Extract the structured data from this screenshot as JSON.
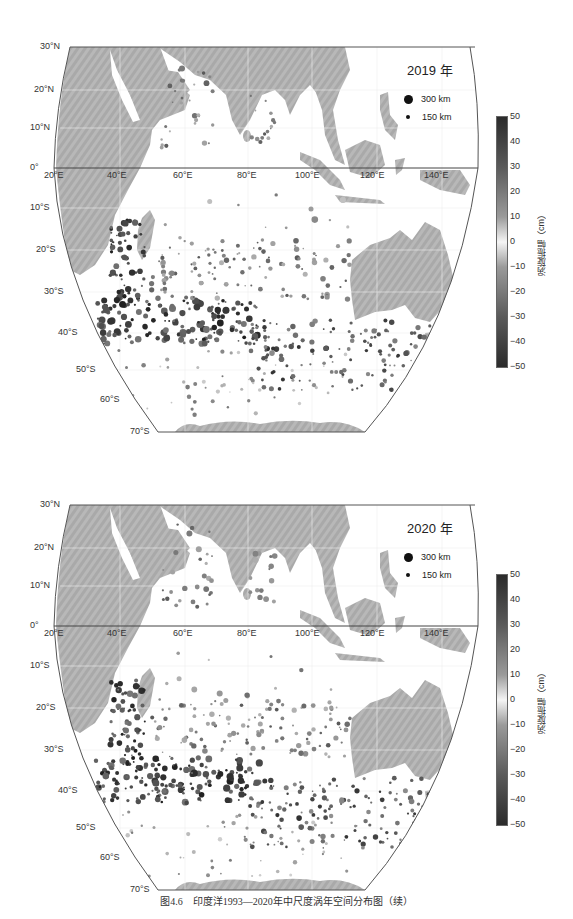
{
  "figure": {
    "caption": "图4.6　印度洋1993—2020年中尺度涡年空间分布图（续）"
  },
  "panels": [
    {
      "year_label": "2019 年",
      "legend": [
        {
          "label": "300 km",
          "size": 9
        },
        {
          "label": "150 km",
          "size": 4
        }
      ],
      "lat_labels": [
        "30°N",
        "20°N",
        "10°N",
        "0°",
        "10°S",
        "20°S",
        "30°S",
        "40°S",
        "50°S",
        "60°S",
        "70°S"
      ],
      "lon_labels": [
        "20°E",
        "40°E",
        "60°E",
        "80°E",
        "100°E",
        "120°E",
        "140°E"
      ],
      "colorbar": {
        "title": "涡旋振幅（cm）",
        "ticks": [
          "50",
          "40",
          "30",
          "20",
          "10",
          "0",
          "−10",
          "−20",
          "−30",
          "−40",
          "−50"
        ]
      }
    },
    {
      "year_label": "2020 年",
      "legend": [
        {
          "label": "300 km",
          "size": 9
        },
        {
          "label": "150 km",
          "size": 4
        }
      ],
      "lat_labels": [
        "30°N",
        "20°N",
        "10°N",
        "0°",
        "10°S",
        "20°S",
        "30°S",
        "40°S",
        "50°S",
        "60°S",
        "70°S"
      ],
      "lon_labels": [
        "20°E",
        "40°E",
        "60°E",
        "80°E",
        "100°E",
        "120°E",
        "140°E"
      ],
      "colorbar": {
        "title": "涡旋振幅（cm）",
        "ticks": [
          "50",
          "40",
          "30",
          "20",
          "10",
          "0",
          "−10",
          "−20",
          "−30",
          "−40",
          "−50"
        ]
      }
    }
  ],
  "chart_data": [
    {
      "type": "scatter",
      "title": "2019 年",
      "subtitle": "Indian Ocean mesoscale eddy spatial distribution",
      "xlabel": "Longitude",
      "ylabel": "Latitude",
      "xlim": [
        20,
        150
      ],
      "ylim": [
        -70,
        30
      ],
      "x_ticks": [
        "20°E",
        "40°E",
        "60°E",
        "80°E",
        "100°E",
        "120°E",
        "140°E"
      ],
      "y_ticks": [
        "30°N",
        "20°N",
        "10°N",
        "0°",
        "10°S",
        "20°S",
        "30°S",
        "40°S",
        "50°S",
        "60°S",
        "70°S"
      ],
      "size_legend": [
        "300 km",
        "150 km"
      ],
      "color_scale": {
        "label": "涡旋振幅（cm）",
        "range": [
          -50,
          50
        ],
        "ticks": [
          50,
          40,
          30,
          20,
          10,
          0,
          -10,
          -20,
          -30,
          -40,
          -50
        ]
      },
      "regions": [
        {
          "name": "Arabian Sea",
          "density": "sparse"
        },
        {
          "name": "Bay of Bengal",
          "density": "sparse"
        },
        {
          "name": "Mozambique Channel / Agulhas",
          "density": "dense",
          "amplitude": "high"
        },
        {
          "name": "Southern Indian Ocean 35°S–45°S band",
          "density": "dense",
          "amplitude": "high"
        },
        {
          "name": "Subtropical south Indian Ocean 20°S–30°S",
          "density": "moderate"
        },
        {
          "name": "South of Australia 40°S–50°S",
          "density": "moderate"
        }
      ]
    },
    {
      "type": "scatter",
      "title": "2020 年",
      "subtitle": "Indian Ocean mesoscale eddy spatial distribution",
      "xlabel": "Longitude",
      "ylabel": "Latitude",
      "xlim": [
        20,
        150
      ],
      "ylim": [
        -70,
        30
      ],
      "x_ticks": [
        "20°E",
        "40°E",
        "60°E",
        "80°E",
        "100°E",
        "120°E",
        "140°E"
      ],
      "y_ticks": [
        "30°N",
        "20°N",
        "10°N",
        "0°",
        "10°S",
        "20°S",
        "30°S",
        "40°S",
        "50°S",
        "60°S",
        "70°S"
      ],
      "size_legend": [
        "300 km",
        "150 km"
      ],
      "color_scale": {
        "label": "涡旋振幅（cm）",
        "range": [
          -50,
          50
        ],
        "ticks": [
          50,
          40,
          30,
          20,
          10,
          0,
          -10,
          -20,
          -30,
          -40,
          -50
        ]
      },
      "regions": [
        {
          "name": "Arabian Sea / Somali coast",
          "density": "sparse"
        },
        {
          "name": "Bay of Bengal",
          "density": "sparse"
        },
        {
          "name": "Mozambique Channel / Agulhas",
          "density": "dense",
          "amplitude": "high"
        },
        {
          "name": "Southern Indian Ocean 35°S–45°S band",
          "density": "dense",
          "amplitude": "high"
        },
        {
          "name": "Subtropical south Indian Ocean 20°S–30°S",
          "density": "moderate"
        },
        {
          "name": "South of Australia 40°S–50°S",
          "density": "moderate"
        }
      ]
    }
  ]
}
